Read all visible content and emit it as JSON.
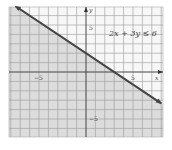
{
  "chart_data": {
    "type": "line",
    "title": "",
    "annotation": "2x + 3y ≤ 6",
    "equation": {
      "a": 2,
      "b": 3,
      "c": 6,
      "relation": "<="
    },
    "boundary_line": {
      "x": [
        -7.5,
        8
      ],
      "y": [
        7,
        -3.33
      ]
    },
    "shaded_region": "below line",
    "xlabel": "x",
    "ylabel": "y",
    "xlim": [
      -8.2,
      8.2
    ],
    "ylim": [
      -6.9,
      6.9
    ],
    "x_ticks_labeled": [
      -5,
      5
    ],
    "y_ticks_labeled": [
      5,
      -5
    ],
    "grid": true,
    "grid_step": 1,
    "colors": {
      "shade": "#dcdcdc",
      "line": "#444444",
      "grid": "#9a9a9a",
      "axis": "#333333"
    }
  },
  "labels": {
    "x_axis": "x",
    "y_axis": "y",
    "x_neg": "−5",
    "x_pos": "5",
    "y_pos": "5",
    "y_neg": "−5",
    "inequality": "2x + 3y ≤ 6"
  }
}
